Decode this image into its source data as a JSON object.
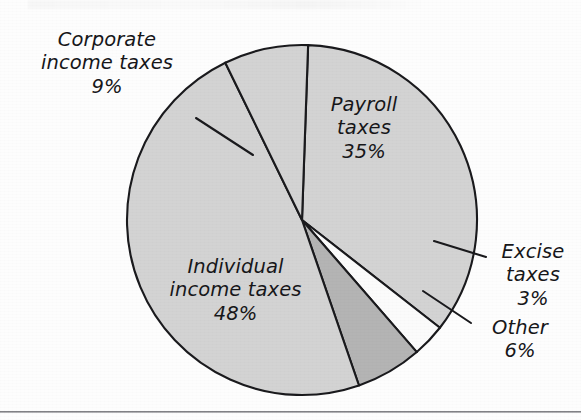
{
  "figure": {
    "type": "pie-chart-figure",
    "background_color": "#fdfdfd",
    "outline_color": "#1a1a1d"
  },
  "chart_data": {
    "type": "pie",
    "title": "",
    "subtitle": "",
    "xlabel": "",
    "ylabel": "",
    "units": "percent",
    "total": 101,
    "legend_position": "none",
    "grid": false,
    "labels_inside": [
      "Payroll taxes",
      "Individual income taxes"
    ],
    "labels_outside": [
      "Corporate income taxes",
      "Excise taxes",
      "Other"
    ],
    "categories": [
      "Individual income taxes",
      "Payroll taxes",
      "Corporate income taxes",
      "Other",
      "Excise taxes"
    ],
    "values": [
      48,
      35,
      9,
      6,
      3
    ],
    "slices": [
      {
        "name": "Payroll taxes",
        "label": "Payroll\ntaxes\n35%",
        "value": 35,
        "value_text": "35%",
        "color": "#d3d3d3",
        "start_angle_deg": -88,
        "end_angle_deg": 38
      },
      {
        "name": "Excise taxes",
        "label": "Excise\ntaxes\n3%",
        "value": 3,
        "value_text": "3%",
        "color": "#fbfbfb",
        "start_angle_deg": 38,
        "end_angle_deg": 49
      },
      {
        "name": "Other",
        "label": "Other\n6%",
        "value": 6,
        "value_text": "6%",
        "color": "#b4b4b4",
        "start_angle_deg": 49,
        "end_angle_deg": 71
      },
      {
        "name": "Individual income taxes",
        "label": "Individual\nincome taxes\n48%",
        "value": 48,
        "value_text": "48%",
        "color": "#d3d3d3",
        "start_angle_deg": 71,
        "end_angle_deg": 244
      },
      {
        "name": "Corporate income taxes",
        "label": "Corporate\nincome taxes\n9%",
        "value": 9,
        "value_text": "9%",
        "color": "#d3d3d3",
        "start_angle_deg": 244,
        "end_angle_deg": 272
      }
    ],
    "geometry": {
      "center_x": 302,
      "center_y": 220,
      "radius": 175
    }
  },
  "labels": {
    "corporate": "Corporate\nincome taxes\n9%",
    "payroll": "Payroll\ntaxes\n35%",
    "individual": "Individual\nincome taxes\n48%",
    "excise": "Excise\ntaxes\n3%",
    "other": "Other\n6%"
  }
}
